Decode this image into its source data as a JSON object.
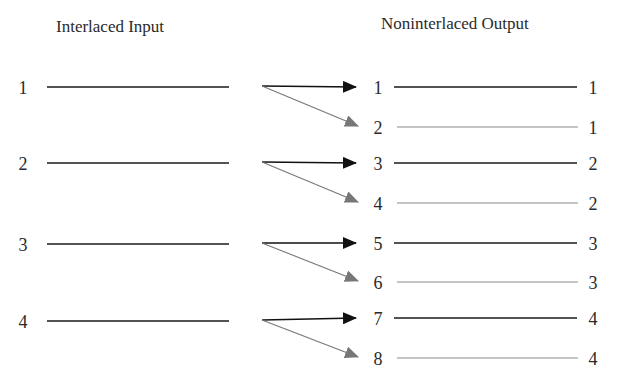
{
  "diagram": {
    "input_title": "Interlaced Input",
    "output_title": "Noninterlaced Output",
    "colors": {
      "primary_line": "#1a1a1a",
      "secondary_line": "#8a8a8a",
      "primary_arrow": "#111111",
      "secondary_arrow": "#777777"
    },
    "input_rows": [
      {
        "label": "1",
        "y": 87
      },
      {
        "label": "2",
        "y": 163
      },
      {
        "label": "3",
        "y": 244
      },
      {
        "label": "4",
        "y": 321
      }
    ],
    "output_rows": [
      {
        "label": "1",
        "source": "1",
        "y": 87,
        "style": "primary"
      },
      {
        "label": "2",
        "source": "1",
        "y": 127,
        "style": "secondary"
      },
      {
        "label": "3",
        "source": "2",
        "y": 163,
        "style": "primary"
      },
      {
        "label": "4",
        "source": "2",
        "y": 203,
        "style": "secondary"
      },
      {
        "label": "5",
        "source": "3",
        "y": 243,
        "style": "primary"
      },
      {
        "label": "6",
        "source": "3",
        "y": 282,
        "style": "secondary"
      },
      {
        "label": "7",
        "source": "4",
        "y": 318,
        "style": "primary"
      },
      {
        "label": "8",
        "source": "4",
        "y": 358,
        "style": "secondary"
      }
    ]
  }
}
